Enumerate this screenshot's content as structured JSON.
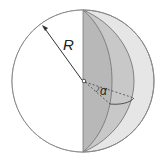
{
  "diagram": {
    "labels": {
      "radius": "R",
      "angle": "α"
    },
    "colors": {
      "outline": "#8a8a8a",
      "white_hemisphere": "#ffffff",
      "back_hemisphere": "#e4e4e4",
      "wedge_face": "#b4b4b4",
      "outer_lune": "#d2d2d2",
      "line": "#555555"
    },
    "sphere": {
      "cx": 83,
      "cy": 81,
      "r": 71
    }
  }
}
